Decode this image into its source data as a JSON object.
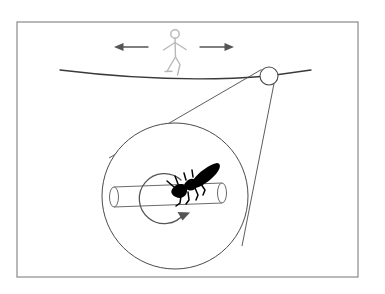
{
  "figure": {
    "background_color": "#ffffff",
    "width": 385,
    "height": 294,
    "border": {
      "name": "figure-border",
      "color": "#8a8a8a",
      "stroke_width": 1.2,
      "x": 17,
      "y": 22,
      "width": 341,
      "height": 255
    }
  },
  "scene": {
    "rope": {
      "label": "tightrope",
      "color": "#3a3a3a",
      "stroke_width": 1.3,
      "path": "M 60 70 Q 175 84 268 76 L 311 70",
      "sag_note": "rope sags downward under the walker"
    },
    "walker": {
      "label": "stick-figure-tightrope-walker",
      "color": "#b8b8b8",
      "stroke_width": 1.4,
      "head_cx": 175,
      "head_cy": 34,
      "head_r": 4.2,
      "body": "M 175 38 L 175 56",
      "arms": "M 164 49 L 175 43 L 186 49",
      "legs": "M 175 56 L 169 68 M 175 56 L 180 64 L 178 74",
      "foot": "M 166 70 L 173 70"
    },
    "arrows": [
      {
        "label": "left-direction-arrow",
        "direction": "left",
        "color": "#555555",
        "stroke_width": 1.4,
        "x1": 148,
        "x2": 115,
        "y": 47,
        "head_size": 5.5
      },
      {
        "label": "right-direction-arrow",
        "direction": "right",
        "color": "#555555",
        "stroke_width": 1.4,
        "x1": 200,
        "x2": 233,
        "y": 47,
        "head_size": 5.5
      }
    ],
    "magnifier_source": {
      "label": "magnified-point-on-rope",
      "color": "#4a4a4a",
      "stroke_width": 1.1,
      "cx": 269,
      "cy": 76,
      "r": 9
    },
    "magnifier_cone": {
      "label": "magnification-cone-lines",
      "color": "#4a4a4a",
      "stroke_width": 0.9,
      "line_upper": "M 262 70 L 110 157",
      "line_lower": "M 275 83 L 243 245"
    },
    "magnifier_circle": {
      "label": "magnified-view-circle",
      "color": "#4a4a4a",
      "stroke_width": 1.0,
      "cx": 175,
      "cy": 196,
      "r": 73
    }
  },
  "magnified_view": {
    "cylinder": {
      "label": "rope-cylinder-cross-section",
      "color": "#6a6a6a",
      "stroke_width": 1.0,
      "x_left": 114,
      "x_right": 222,
      "y_left": 197,
      "y_right": 193,
      "half_height": 10,
      "cap_rx": 4.5,
      "cap_ry": 10
    },
    "rotation_arrow": {
      "label": "rope-rotation-arrow",
      "color": "#555555",
      "stroke_width": 1.3,
      "direction": "counterclockwise",
      "cx": 160,
      "cy": 196,
      "r": 25,
      "arrowhead_at": "bottom-right"
    },
    "insect": {
      "label": "insect-silhouette-on-rope",
      "species_hint": "ant",
      "fill": "#000000",
      "position": {
        "x": 168,
        "y": 166,
        "width": 54,
        "height": 42
      },
      "orientation": "head lower-left, abdomen upper-right"
    }
  }
}
